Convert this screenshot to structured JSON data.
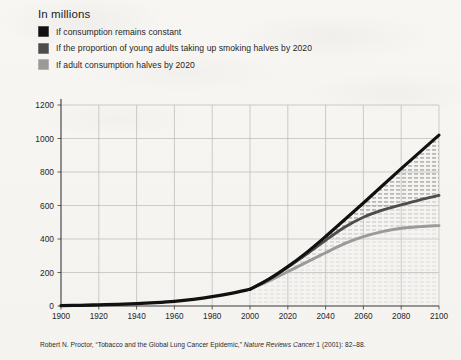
{
  "page": {
    "background_color": "#f6f5f2"
  },
  "chart_title": "In millions",
  "legend": {
    "items": [
      {
        "label": "If consumption remains constant",
        "color": "#111111",
        "swatch_name": "legend-swatch-constant"
      },
      {
        "label": "If the proportion of young adults taking up smoking halves by 2020",
        "color": "#4d4d4d",
        "swatch_name": "legend-swatch-youth-halves"
      },
      {
        "label": "If adult consumption halves by 2020",
        "color": "#9a9a9a",
        "swatch_name": "legend-swatch-adult-halves"
      }
    ]
  },
  "caption": {
    "before": "Robert N. Proctor, “Tobacco and the Global Lung Cancer Epidemic,” ",
    "italic": "Nature Reviews Cancer",
    "after": " 1 (2001): 82–88."
  },
  "axes": {
    "y_ticks": [
      "0",
      "200",
      "400",
      "600",
      "800",
      "1000",
      "1200"
    ],
    "x_ticks": [
      "1900",
      "1920",
      "1940",
      "1960",
      "1980",
      "2000",
      "2020",
      "2040",
      "2060",
      "2080",
      "2100"
    ]
  },
  "chart_data": {
    "type": "line",
    "title": "In millions",
    "xlabel": "",
    "ylabel": "In millions",
    "xlim": [
      1900,
      2100
    ],
    "ylim": [
      0,
      1200
    ],
    "ytick_step": 200,
    "xtick_step": 20,
    "grid": true,
    "legend_position": "top-left",
    "x": [
      1900,
      1910,
      1920,
      1930,
      1940,
      1950,
      1960,
      1970,
      1980,
      1990,
      2000,
      2010,
      2020,
      2030,
      2040,
      2050,
      2060,
      2070,
      2080,
      2090,
      2100
    ],
    "series": [
      {
        "name": "If consumption remains constant",
        "color": "#111111",
        "values": [
          2,
          4,
          7,
          10,
          14,
          20,
          28,
          40,
          56,
          76,
          100,
          160,
          235,
          320,
          415,
          515,
          615,
          718,
          820,
          920,
          1020
        ]
      },
      {
        "name": "If the proportion of young adults taking up smoking halves by 2020",
        "color": "#4d4d4d",
        "values": [
          2,
          4,
          7,
          10,
          14,
          20,
          28,
          40,
          56,
          76,
          100,
          160,
          232,
          310,
          392,
          470,
          530,
          572,
          604,
          634,
          660
        ]
      },
      {
        "name": "If adult consumption halves by 2020",
        "color": "#9a9a9a",
        "values": [
          2,
          4,
          7,
          10,
          14,
          20,
          28,
          40,
          56,
          76,
          100,
          150,
          205,
          262,
          318,
          372,
          414,
          444,
          464,
          474,
          480
        ]
      }
    ],
    "historical_split_year": 2000
  }
}
